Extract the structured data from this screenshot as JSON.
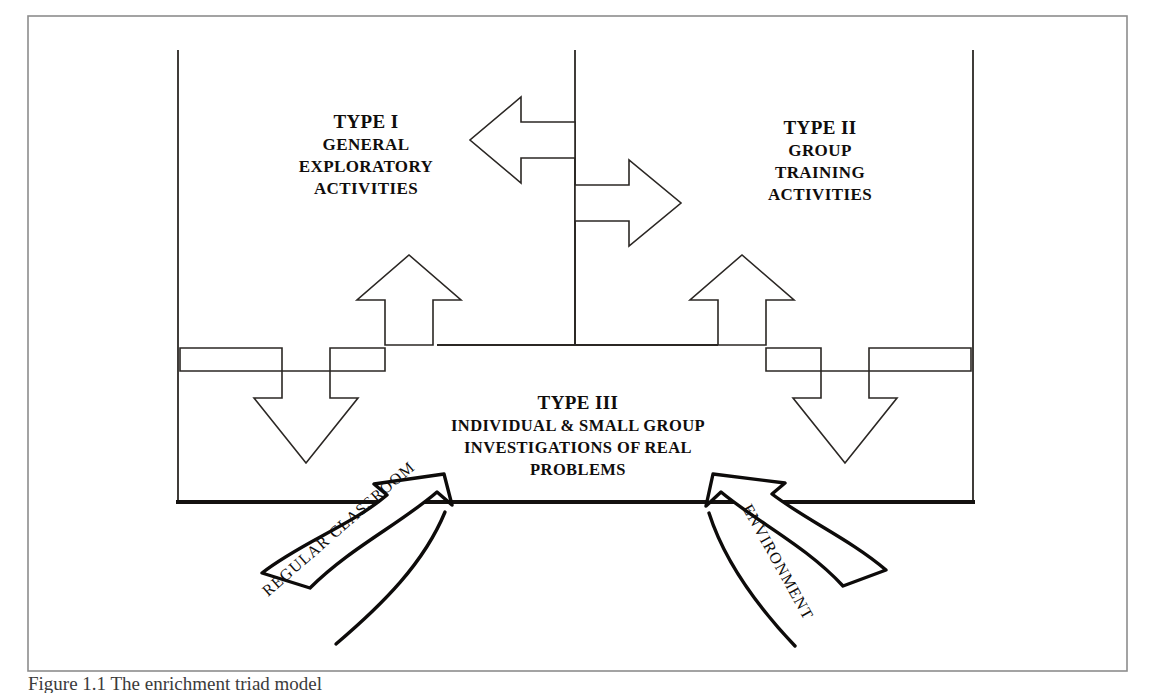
{
  "figure": {
    "title": "The Enrichment Triad Model",
    "frame_color": "#8d8d8d",
    "ink_color": "#100d0c"
  },
  "type1": {
    "heading": "TYPE I",
    "line1": "GENERAL",
    "line2": "EXPLORATORY",
    "line3": "ACTIVITIES"
  },
  "type2": {
    "heading": "TYPE II",
    "line1": "GROUP",
    "line2": "TRAINING",
    "line3": "ACTIVITIES"
  },
  "type3": {
    "heading": "TYPE III",
    "line1": "INDIVIDUAL & SMALL GROUP",
    "line2": "INVESTIGATIONS OF REAL",
    "line3": "PROBLEMS"
  },
  "inflow": {
    "left_label": "REGULAR CLASSROOM",
    "right_label": "ENVIRONMENT"
  },
  "caption": {
    "text": "Figure 1.1 The enrichment triad model"
  }
}
